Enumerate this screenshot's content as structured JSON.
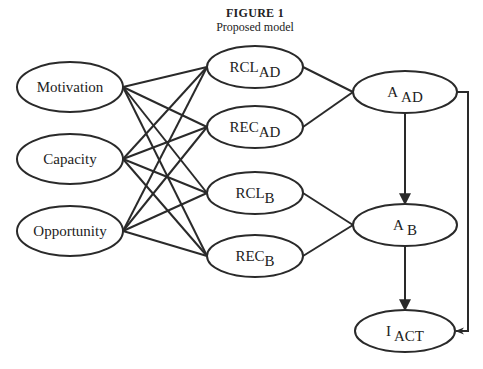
{
  "figure": {
    "number": "FIGURE 1",
    "caption": "Proposed model"
  },
  "nodes": {
    "motivation": {
      "label": "Motivation",
      "sub": ""
    },
    "capacity": {
      "label": "Capacity",
      "sub": ""
    },
    "opportunity": {
      "label": "Opportunity",
      "sub": ""
    },
    "rcl_ad": {
      "label": "RCL",
      "sub": "AD"
    },
    "rec_ad": {
      "label": "REC",
      "sub": "AD"
    },
    "rcl_b": {
      "label": "RCL",
      "sub": "B"
    },
    "rec_b": {
      "label": "REC",
      "sub": "B"
    },
    "a_ad": {
      "label": "A",
      "sub": "AD"
    },
    "a_b": {
      "label": "A",
      "sub": "B"
    },
    "i_act": {
      "label": "I",
      "sub": "ACT"
    }
  },
  "edges": [
    {
      "from": "motivation",
      "to": "rcl_ad",
      "directed": false
    },
    {
      "from": "motivation",
      "to": "rec_ad",
      "directed": false
    },
    {
      "from": "motivation",
      "to": "rcl_b",
      "directed": false
    },
    {
      "from": "motivation",
      "to": "rec_b",
      "directed": false
    },
    {
      "from": "capacity",
      "to": "rcl_ad",
      "directed": false
    },
    {
      "from": "capacity",
      "to": "rec_ad",
      "directed": false
    },
    {
      "from": "capacity",
      "to": "rcl_b",
      "directed": false
    },
    {
      "from": "capacity",
      "to": "rec_b",
      "directed": false
    },
    {
      "from": "opportunity",
      "to": "rcl_ad",
      "directed": false
    },
    {
      "from": "opportunity",
      "to": "rec_ad",
      "directed": false
    },
    {
      "from": "opportunity",
      "to": "rcl_b",
      "directed": false
    },
    {
      "from": "opportunity",
      "to": "rec_b",
      "directed": false
    },
    {
      "from": "rcl_ad",
      "to": "a_ad",
      "directed": false
    },
    {
      "from": "rec_ad",
      "to": "a_ad",
      "directed": false
    },
    {
      "from": "rcl_b",
      "to": "a_b",
      "directed": false
    },
    {
      "from": "rec_b",
      "to": "a_b",
      "directed": false
    },
    {
      "from": "a_ad",
      "to": "a_b",
      "directed": true
    },
    {
      "from": "a_b",
      "to": "i_act",
      "directed": true
    },
    {
      "from": "a_ad",
      "to": "i_act",
      "directed": true,
      "routing": "right-side elbow"
    }
  ]
}
